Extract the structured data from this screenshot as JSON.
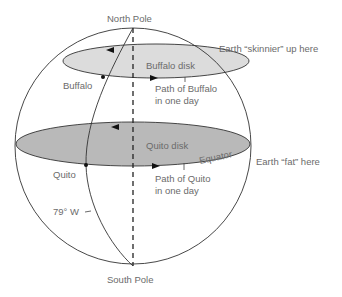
{
  "labels": {
    "north_pole": "North Pole",
    "south_pole": "South Pole",
    "earth_skinnier": "Earth “skinnier” up here",
    "earth_fat": "Earth “fat” here",
    "buffalo": "Buffalo",
    "buffalo_disk": "Buffalo disk",
    "path_buffalo_1": "Path of Buffalo",
    "path_buffalo_2": "in one day",
    "quito": "Quito",
    "quito_disk": "Quito disk",
    "equator": "Equator",
    "path_quito_1": "Path of Quito",
    "path_quito_2": "in one day",
    "longitude": "79° W"
  },
  "colors": {
    "outline": "#333333",
    "buffalo_disk_fill": "#dcdcdc",
    "quito_disk_fill": "#b9b9b9",
    "text": "#6b6b6b"
  }
}
